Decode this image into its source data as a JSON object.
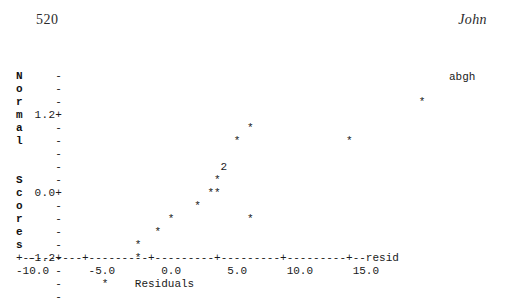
{
  "header": {
    "page_number": "520",
    "running_head": "John"
  },
  "chart_data": {
    "type": "scatter",
    "title": "",
    "subtitle": "",
    "xlabel": "Residuals",
    "ylabel": "Normal Scores",
    "axis_end_label": "resid",
    "grid": false,
    "legend_position": "none",
    "xlim": [
      -10.0,
      17.5
    ],
    "ylim": [
      -1.8,
      1.8
    ],
    "x_tick_labels": [
      "-10.0",
      "-5.0",
      "0.0",
      "5.0",
      "10.0",
      "15.0"
    ],
    "x_tick_values": [
      -10.0,
      -5.0,
      0.0,
      5.0,
      10.0,
      15.0
    ],
    "x_axis_line": "+---------+---------+---------+---------+---------+--resid",
    "x_axis_label_line": "-10.0      -5.0       0.0       5.0      10.0      15.0",
    "y_axis_name_chars": [
      "N",
      "o",
      "r",
      "m",
      "a",
      "l",
      " ",
      " ",
      "S",
      "c",
      "o",
      "r",
      "e",
      "s",
      " ",
      " ",
      " "
    ],
    "y_tick_labels": [
      "-",
      "-",
      "-",
      "1.2+",
      "-",
      "-",
      "-",
      "-",
      "0.0+",
      "-",
      "-",
      "-",
      "-",
      "-1.2+",
      "-",
      "-",
      "-"
    ],
    "y_tick_values": [
      null,
      null,
      null,
      1.2,
      null,
      null,
      null,
      null,
      0.0,
      null,
      null,
      null,
      null,
      -1.2,
      null,
      null,
      null
    ],
    "point_marker": "*",
    "rows": [
      {
        "y_char": "N",
        "tick": "-",
        "points": ""
      },
      {
        "y_char": "o",
        "tick": "-",
        "points": ""
      },
      {
        "y_char": "r",
        "tick": "-",
        "points": "                                                      *"
      },
      {
        "y_char": "m",
        "tick": "1.2+",
        "points": ""
      },
      {
        "y_char": "a",
        "tick": "-",
        "points": "                            *"
      },
      {
        "y_char": "l",
        "tick": "-",
        "points": "                          *                *"
      },
      {
        "y_char": " ",
        "tick": "-",
        "points": ""
      },
      {
        "y_char": " ",
        "tick": "-",
        "points": "                        2"
      },
      {
        "y_char": "S",
        "tick": "-",
        "points": "                       *"
      },
      {
        "y_char": "c",
        "tick": "0.0+",
        "points": "                      **"
      },
      {
        "y_char": "o",
        "tick": "-",
        "points": "                    *"
      },
      {
        "y_char": "r",
        "tick": "-",
        "points": "                *           *"
      },
      {
        "y_char": "e",
        "tick": "-",
        "points": "              *"
      },
      {
        "y_char": "s",
        "tick": "-",
        "points": "           *"
      },
      {
        "y_char": " ",
        "tick": "-1.2+",
        "points": "           *"
      },
      {
        "y_char": " ",
        "tick": "-",
        "points": ""
      },
      {
        "y_char": " ",
        "tick": "-",
        "points": "      *"
      },
      {
        "y_char": " ",
        "tick": "-",
        "points": ""
      }
    ],
    "data_points": [
      {
        "x": -8.1,
        "y": -1.6,
        "count": 1
      },
      {
        "x": -4.3,
        "y": -1.22,
        "count": 1
      },
      {
        "x": -4.3,
        "y": -1.0,
        "count": 1
      },
      {
        "x": -3.3,
        "y": -0.78,
        "count": 1
      },
      {
        "x": -1.8,
        "y": -0.58,
        "count": 1
      },
      {
        "x": -0.9,
        "y": -0.4,
        "count": 1
      },
      {
        "x": 0.2,
        "y": -0.22,
        "count": 1
      },
      {
        "x": 0.6,
        "y": -0.1,
        "count": 2
      },
      {
        "x": 0.9,
        "y": 0.1,
        "count": 1
      },
      {
        "x": 1.2,
        "y": 0.3,
        "count": 2
      },
      {
        "x": 1.9,
        "y": 0.58,
        "count": 1
      },
      {
        "x": 2.6,
        "y": 0.78,
        "count": 1
      },
      {
        "x": 7.5,
        "y": 0.78,
        "count": 1
      },
      {
        "x": 16.8,
        "y": 1.3,
        "count": 1
      }
    ],
    "annotations": [
      {
        "text": "2",
        "x_px": 226,
        "y_px": 122,
        "note": "two overlapping points"
      },
      {
        "text": "abgh",
        "x_px": 449,
        "y_px": 71,
        "note": "outlier label"
      }
    ]
  }
}
